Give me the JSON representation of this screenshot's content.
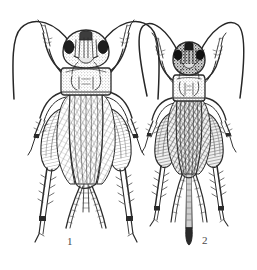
{
  "plate": {
    "kind": "scientific-illustration",
    "subject": "two crickets, dorsal view, line engraving",
    "background_color": "#ffffff",
    "ink_color": "#2b2b2b",
    "shade_color": "#6e6e6e",
    "width": 257,
    "height": 270
  },
  "figures": [
    {
      "id": "figure-1",
      "label": "1",
      "label_x": 67,
      "label_y": 236,
      "description": "male cricket, large, long forewings covering abdomen, two cerci, no ovipositor",
      "body_center_x": 86,
      "head_y": 36,
      "antennae": 2,
      "legs": 6,
      "cerci": 2,
      "ovipositor": false
    },
    {
      "id": "figure-2",
      "label": "2",
      "label_x": 202,
      "label_y": 235,
      "description": "female cricket, smaller, dark forewings, two cerci flanking a long straight ovipositor",
      "body_center_x": 189,
      "head_y": 48,
      "antennae": 2,
      "legs": 6,
      "cerci": 2,
      "ovipositor": true
    }
  ],
  "icons": {
    "cricket": "cricket-icon",
    "antenna": "antenna-icon",
    "leg": "leg-icon",
    "wing": "wing-icon",
    "ovipositor": "ovipositor-icon"
  }
}
